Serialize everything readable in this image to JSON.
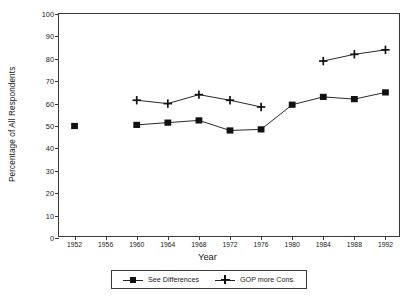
{
  "chart_data": {
    "type": "line",
    "title": "",
    "xlabel": "Year",
    "ylabel": "Percentage of All Respondents",
    "xlim": [
      1950,
      1994
    ],
    "ylim": [
      0,
      100
    ],
    "ytick_step": 10,
    "grid": false,
    "legend_position": "bottom-center",
    "categories": [
      1952,
      1956,
      1960,
      1964,
      1968,
      1972,
      1976,
      1980,
      1984,
      1988,
      1992
    ],
    "xticks": [
      "1952",
      "1956",
      "1960",
      "1964",
      "1968",
      "1972",
      "1976",
      "1980",
      "1984",
      "1988",
      "1992"
    ],
    "yticks": [
      "0",
      "10",
      "20",
      "30",
      "40",
      "50",
      "60",
      "70",
      "80",
      "90",
      "100"
    ],
    "series": [
      {
        "name": "See Differences",
        "marker": "square",
        "x": [
          1952,
          1960,
          1964,
          1968,
          1972,
          1976,
          1980,
          1984,
          1988,
          1992
        ],
        "values": [
          50,
          50.5,
          51.5,
          52.5,
          48,
          48.5,
          59.5,
          63,
          62,
          65
        ],
        "segments": [
          [
            1952
          ],
          [
            1960,
            1964,
            1968,
            1972,
            1976,
            1980,
            1984,
            1988,
            1992
          ]
        ]
      },
      {
        "name": "GOP more Cons.",
        "marker": "plus",
        "x": [
          1960,
          1964,
          1968,
          1972,
          1976,
          1984,
          1988,
          1992
        ],
        "values": [
          61.5,
          60,
          64,
          61.5,
          58.5,
          79,
          82,
          84
        ],
        "segments": [
          [
            1960,
            1964,
            1968,
            1972,
            1976
          ],
          [
            1984,
            1988,
            1992
          ]
        ]
      }
    ]
  },
  "legend": {
    "items": [
      {
        "label": "See Differences",
        "marker": "square"
      },
      {
        "label": "GOP more Cons.",
        "marker": "plus"
      }
    ]
  },
  "colors": {
    "axis": "#3a3a3a",
    "series_see_differences": "#111111",
    "series_gop_more_cons": "#111111",
    "background": "#ffffff"
  }
}
